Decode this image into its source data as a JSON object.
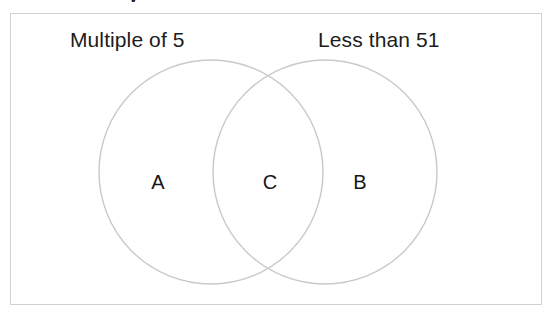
{
  "figure": {
    "type": "venn-diagram",
    "clipped_text_fragment": "y",
    "frame": {
      "border_color": "#d2d2d2",
      "background_color": "#ffffff"
    },
    "circle_stroke_color": "#c9c9c9",
    "text_color": "#1c1c1c",
    "sets": [
      {
        "id": "left",
        "label": "Multiple of 5",
        "center_x": 211,
        "center_y": 172,
        "radius": 112
      },
      {
        "id": "right",
        "label": "Less than 51",
        "center_x": 325,
        "center_y": 172,
        "radius": 112
      }
    ],
    "regions": [
      {
        "id": "a",
        "label": "A",
        "description": "left-only"
      },
      {
        "id": "c",
        "label": "C",
        "description": "intersection"
      },
      {
        "id": "b",
        "label": "B",
        "description": "right-only"
      }
    ]
  }
}
